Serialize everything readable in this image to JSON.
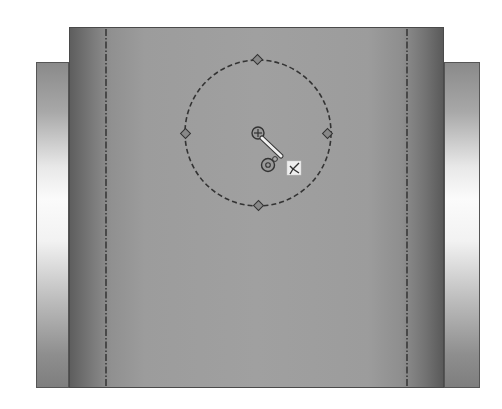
{
  "viewport": {
    "background": "#ffffff",
    "model": {
      "main_face": {
        "x": 69,
        "y": 27,
        "width": 375,
        "height": 361,
        "color": "#a0a0a0"
      },
      "left_tab": {
        "x": 36,
        "y": 62,
        "width": 33,
        "height": 326
      },
      "right_tab": {
        "x": 444,
        "y": 62,
        "width": 36,
        "height": 326
      },
      "construction_lines": [
        {
          "x": 106
        },
        {
          "x": 407
        }
      ]
    },
    "sketch": {
      "circle": {
        "cx": 258,
        "cy": 133,
        "r": 73,
        "style": "dashed",
        "color": "#3a3a3a"
      },
      "quadrant_points": [
        "top",
        "right",
        "bottom",
        "left"
      ],
      "icons": [
        {
          "name": "center-point-icon",
          "x": 258,
          "y": 133
        },
        {
          "name": "origin-icon",
          "x": 268,
          "y": 165
        },
        {
          "name": "fix-constraint-icon",
          "x": 294,
          "y": 168
        }
      ]
    }
  }
}
